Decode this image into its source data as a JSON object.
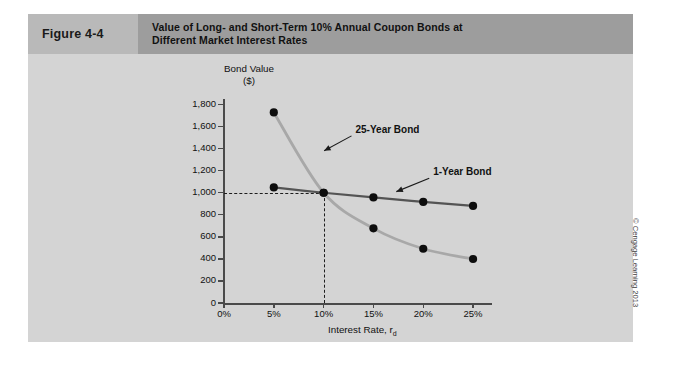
{
  "figure": {
    "number_label": "Figure 4-4",
    "title_line1": "Value of Long- and Short-Term 10% Annual Coupon Bonds at",
    "title_line2": "Different Market Interest Rates"
  },
  "credit": "© Cengage Learning 2013",
  "colors": {
    "panel_bg": "#d4d4d4",
    "header_num_band": "#b9b9b9",
    "header_title_band": "#9d9d9d",
    "series_25yr": "#a8a8a8",
    "series_1yr": "#545454",
    "marker": "#0d0d0d",
    "axis": "#4a4a4a",
    "guide_dash": "#1d1d1d"
  },
  "chart_data": {
    "type": "line",
    "title": "Value of Long- and Short-Term 10% Annual Coupon Bonds at Different Market Interest Rates",
    "subtitle": "",
    "xlabel": "Interest Rate, rd",
    "xlabel_main": "Interest Rate, r",
    "xlabel_sub": "d",
    "ylabel": "Bond Value ($)",
    "ylabel_line1": "Bond Value",
    "ylabel_line2": "($)",
    "x": [
      5,
      10,
      15,
      20,
      25
    ],
    "xtick_labels": [
      "0%",
      "5%",
      "10%",
      "15%",
      "20%",
      "25%"
    ],
    "xtick_values": [
      0,
      5,
      10,
      15,
      20,
      25
    ],
    "xlim": [
      0,
      26.5
    ],
    "ytick_labels": [
      "0",
      "200",
      "400",
      "600",
      "800",
      "1,000",
      "1,200",
      "1,400",
      "1,600",
      "1,800"
    ],
    "ytick_values": [
      0,
      200,
      400,
      600,
      800,
      1000,
      1200,
      1400,
      1600,
      1800
    ],
    "ylim": [
      0,
      1850
    ],
    "grid": false,
    "legend_position": "inline-annotations",
    "series": [
      {
        "name": "25-Year Bond",
        "color": "#a8a8a8",
        "values": [
          1728,
          1000,
          677,
          492,
          399
        ]
      },
      {
        "name": "1-Year Bond",
        "color": "#545454",
        "values": [
          1048,
          1000,
          957,
          917,
          880
        ]
      }
    ],
    "annotations": [
      {
        "text": "25-Year Bond",
        "x": 13.2,
        "y": 1570
      },
      {
        "text": "1-Year Bond",
        "x": 21.0,
        "y": 1185
      }
    ],
    "guides": [
      {
        "type": "hline",
        "value": 1000,
        "from_x": 0,
        "to_x": 10,
        "style": "dashed"
      },
      {
        "type": "vline",
        "value": 10,
        "from_y": 0,
        "to_y": 1000,
        "style": "dashed"
      }
    ]
  }
}
